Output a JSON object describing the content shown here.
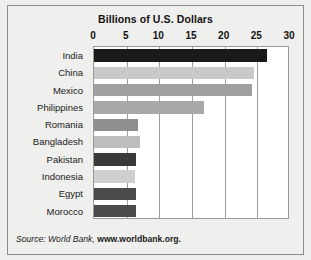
{
  "chart_data": {
    "type": "bar",
    "orientation": "horizontal",
    "title": "Billions of U.S. Dollars",
    "xlabel": "",
    "ylabel": "",
    "xlim": [
      0,
      30
    ],
    "xticks": [
      0,
      5,
      10,
      15,
      20,
      25,
      30
    ],
    "xticklabels": [
      "0",
      "5",
      "10",
      "15",
      "20",
      "25",
      "30"
    ],
    "grid": true,
    "grid_axis": "x",
    "legend": false,
    "categories": [
      "India",
      "China",
      "Mexico",
      "Philippines",
      "Romania",
      "Bangladesh",
      "Pakistan",
      "Indonesia",
      "Egypt",
      "Morocco"
    ],
    "values": [
      26.5,
      24.5,
      24.2,
      16.8,
      6.8,
      7.0,
      6.5,
      6.3,
      6.4,
      6.4
    ],
    "bar_colors": [
      "#1a1a1a",
      "#c9c9c9",
      "#a0a0a0",
      "#a8a8a8",
      "#8f8f8f",
      "#bdbdbd",
      "#3a3a3a",
      "#cfcfcf",
      "#4a4a4a",
      "#4a4a4a"
    ],
    "source_prefix": "Source: World Bank, ",
    "source_link": "www.worldbank.org."
  }
}
